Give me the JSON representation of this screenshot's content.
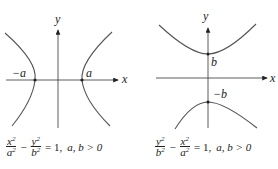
{
  "diagrams": [
    {
      "name": "horizontal-hyperbola",
      "axis_x_label": "x",
      "axis_y_label": "y",
      "vertex_left_label": "−a",
      "vertex_right_label": "a",
      "equation": {
        "term1_num": "x",
        "term1_den": "a",
        "term2_num": "y",
        "term2_den": "b",
        "exp": "2",
        "minus": "−",
        "equals": "= 1,",
        "condition": "a, b > 0"
      }
    },
    {
      "name": "vertical-hyperbola",
      "axis_x_label": "x",
      "axis_y_label": "y",
      "vertex_top_label": "b",
      "vertex_bottom_label": "−b",
      "equation": {
        "term1_num": "y",
        "term1_den": "b",
        "term2_num": "x",
        "term2_den": "a",
        "exp": "2",
        "minus": "−",
        "equals": "= 1,",
        "condition": "a, b > 0"
      }
    }
  ],
  "colors": {
    "curve": "#555555",
    "axis": "#333333",
    "point": "#222222"
  }
}
